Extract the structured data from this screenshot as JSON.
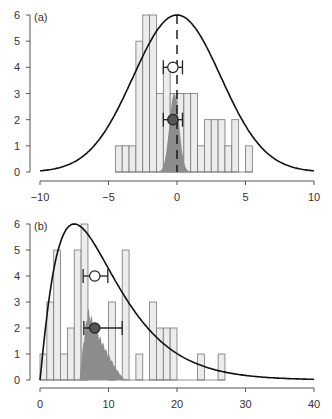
{
  "colors": {
    "bar_fill": "#ececec",
    "bar_stroke": "#777777",
    "density_fill": "#8c8c8c",
    "curve": "#111111",
    "axis": "#555555",
    "filled_point": "#555555",
    "open_point": "#ffffff"
  },
  "chart_data": [
    {
      "panel_label": "(a)",
      "type": "bar",
      "title": "",
      "xlabel": "",
      "ylabel": "",
      "xlim": [
        -10,
        10
      ],
      "ylim": [
        0,
        6
      ],
      "x_ticks": [
        -10,
        -5,
        0,
        5,
        10
      ],
      "x_tick_labels": [
        "−10",
        "−5",
        "0",
        "5",
        "10"
      ],
      "y_ticks": [
        0,
        1,
        2,
        3,
        4,
        5,
        6
      ],
      "y_tick_labels": [
        "0",
        "1",
        "2",
        "3",
        "4",
        "5",
        "6"
      ],
      "grid": false,
      "histogram": {
        "bin_width": 0.5,
        "bin_start": -4.5,
        "counts": [
          1,
          1,
          1,
          5,
          6,
          6,
          3,
          4,
          3,
          3,
          3,
          3,
          1,
          2,
          2,
          2,
          1,
          2,
          0,
          1
        ]
      },
      "curve": {
        "type": "normal",
        "mean": 0,
        "sd": 3.2,
        "peak": 6
      },
      "density": {
        "type": "normal",
        "mean": -0.2,
        "sd": 0.35,
        "peak": 3
      },
      "reference_line": {
        "x": 0,
        "style": "dashed"
      },
      "points": [
        {
          "name": "open-estimate",
          "x": -0.3,
          "y": 4,
          "ci_low": -1.0,
          "ci_high": 0.4,
          "filled": false
        },
        {
          "name": "filled-estimate",
          "x": -0.3,
          "y": 2,
          "ci_low": -1.0,
          "ci_high": 0.4,
          "filled": true
        }
      ]
    },
    {
      "panel_label": "(b)",
      "type": "bar",
      "title": "",
      "xlabel": "",
      "ylabel": "",
      "xlim": [
        0,
        40
      ],
      "ylim": [
        0,
        6
      ],
      "x_ticks": [
        0,
        10,
        20,
        30,
        40
      ],
      "x_tick_labels": [
        "0",
        "10",
        "20",
        "30",
        "40"
      ],
      "y_ticks": [
        0,
        1,
        2,
        3,
        4,
        5,
        6
      ],
      "y_tick_labels": [
        "0",
        "1",
        "2",
        "3",
        "4",
        "5",
        "6"
      ],
      "grid": false,
      "histogram": {
        "bin_width": 1,
        "bin_start": 0,
        "counts": [
          1,
          3,
          5,
          1,
          2,
          5,
          6,
          0,
          0,
          0,
          3,
          0,
          5,
          0,
          1,
          0,
          3,
          2,
          2,
          2,
          0,
          0,
          0,
          1,
          0,
          0,
          1
        ]
      },
      "curve": {
        "type": "gamma",
        "shape": 2.1,
        "mode": 5,
        "peak": 6
      },
      "density": {
        "type": "skewed",
        "mode": 7,
        "low": 5.8,
        "high": 12.5,
        "peak": 2.8
      },
      "points": [
        {
          "name": "open-estimate",
          "x": 8,
          "y": 4,
          "ci_low": 6.3,
          "ci_high": 9.9,
          "filled": false
        },
        {
          "name": "filled-estimate",
          "x": 8,
          "y": 2,
          "ci_low": 6.4,
          "ci_high": 12,
          "filled": true
        }
      ]
    }
  ]
}
